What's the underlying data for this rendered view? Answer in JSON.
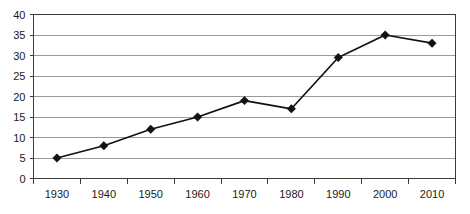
{
  "chart_data": {
    "type": "line",
    "title": "",
    "subtitle": "",
    "xlabel": "",
    "ylabel": "",
    "categories": [
      "1930",
      "1940",
      "1950",
      "1960",
      "1970",
      "1980",
      "1990",
      "2000",
      "2010"
    ],
    "values": [
      5,
      8,
      12,
      15,
      19,
      17,
      29.5,
      35,
      33
    ],
    "series": [
      {
        "name": "",
        "values": [
          5,
          8,
          12,
          15,
          19,
          17,
          29.5,
          35,
          33
        ]
      }
    ],
    "ylim": [
      0,
      40
    ],
    "yticks": [
      "0",
      "5",
      "10",
      "15",
      "20",
      "25",
      "30",
      "35",
      "40"
    ],
    "ytick_values": [
      0,
      5,
      10,
      15,
      20,
      25,
      30,
      35,
      40
    ],
    "xticks": [
      "1930",
      "1940",
      "1950",
      "1960",
      "1970",
      "1980",
      "1990",
      "2000",
      "2010"
    ],
    "grid": "horizontal",
    "legend": "none",
    "marker": "diamond",
    "line_color": "#111111",
    "marker_color": "#111111",
    "gridline_color": "#9a9a9a",
    "axis_color": "#3a3a3a",
    "background_color": "#ffffff"
  }
}
